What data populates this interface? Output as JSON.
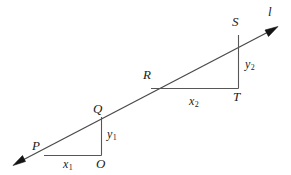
{
  "figure": {
    "type": "geometry-diagram",
    "background_color": "#ffffff",
    "stroke_color": "#4a4a4a",
    "text_color": "#1b1b1b"
  },
  "labels": {
    "line_name": "l",
    "point_p": "P",
    "point_q": "Q",
    "point_o": "O",
    "point_r": "R",
    "point_s": "S",
    "point_t": "T",
    "run_1": "x",
    "run_1_sub": "1",
    "rise_1": "y",
    "rise_1_sub": "1",
    "run_2": "x",
    "run_2_sub": "2",
    "rise_2": "y",
    "rise_2_sub": "2"
  },
  "geometry": {
    "line": {
      "from": [
        13,
        165
      ],
      "to": [
        277,
        27
      ],
      "double_arrow": true
    },
    "points": {
      "P": [
        44,
        155
      ],
      "Q": [
        101,
        117
      ],
      "O": [
        101,
        155
      ],
      "R": [
        151,
        88
      ],
      "S": [
        238,
        35
      ],
      "T": [
        238,
        88
      ]
    },
    "triangle_small": {
      "vertices": [
        [
          44,
          155
        ],
        [
          101,
          155
        ],
        [
          101,
          117
        ]
      ]
    },
    "triangle_large": {
      "vertices": [
        [
          151,
          88
        ],
        [
          238,
          88
        ],
        [
          238,
          35
        ]
      ]
    }
  }
}
